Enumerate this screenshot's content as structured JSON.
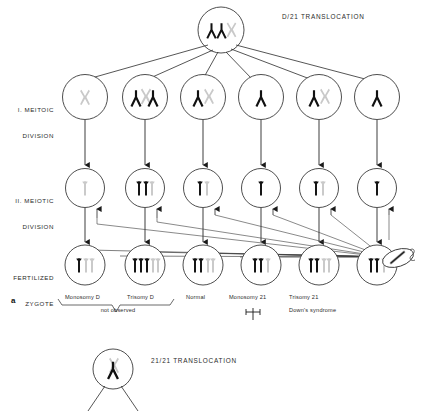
{
  "figure": {
    "panel_letter": "a",
    "title_top": "D/21 TRANSLOCATION",
    "title_bottom": "21/21 TRANSLOCATION",
    "row_labels": [
      {
        "line1": "I. MEITOIC",
        "line2": "DIVISION"
      },
      {
        "line1": "II. MEIOTIC",
        "line2": "DIVISION"
      },
      {
        "line1": "FERTILIZED",
        "line2": "ZYGOTE"
      }
    ],
    "outcome_labels": [
      {
        "text": "Monosomy D"
      },
      {
        "text": "Trisomy D"
      },
      {
        "text": "Normal"
      },
      {
        "text": "Monosomy 21"
      },
      {
        "text": "Trisomy 21"
      },
      {
        "text": "Down's syndrome"
      },
      {
        "text": "not observed"
      }
    ],
    "colors": {
      "chromosome_black": "#111111",
      "chromosome_gray": "#c9c9c9",
      "outline": "#3a3a3a",
      "text": "#2a2a2a"
    },
    "parent_cell": {
      "name": "D/21 translocation carrier",
      "chromosomes": [
        "translocation-black",
        "black",
        "gray"
      ]
    },
    "meiosis_i_cells": [
      {
        "id": 1,
        "chromosomes": [
          "gray"
        ]
      },
      {
        "id": 2,
        "chromosomes": [
          "black",
          "gray-overlap",
          "black"
        ]
      },
      {
        "id": 3,
        "chromosomes": [
          "black",
          "gray"
        ]
      },
      {
        "id": 4,
        "chromosomes": [
          "black"
        ]
      },
      {
        "id": 5,
        "chromosomes": [
          "black",
          "gray"
        ]
      },
      {
        "id": 6,
        "chromosomes": [
          "black"
        ]
      }
    ],
    "meiosis_ii_cells": [
      {
        "id": 1,
        "chromosomes": [
          "gray"
        ]
      },
      {
        "id": 2,
        "chromosomes": [
          "black",
          "black",
          "gray"
        ]
      },
      {
        "id": 3,
        "chromosomes": [
          "black",
          "gray"
        ]
      },
      {
        "id": 4,
        "chromosomes": [
          "black"
        ]
      },
      {
        "id": 5,
        "chromosomes": [
          "black",
          "gray"
        ]
      },
      {
        "id": 6,
        "chromosomes": [
          "black"
        ]
      }
    ],
    "zygote_cells": [
      {
        "id": 1,
        "chromosomes": [
          "black",
          "gray",
          "gray"
        ]
      },
      {
        "id": 2,
        "chromosomes": [
          "black",
          "black",
          "black",
          "gray",
          "gray"
        ]
      },
      {
        "id": 3,
        "chromosomes": [
          "black",
          "black",
          "gray",
          "gray"
        ]
      },
      {
        "id": 4,
        "chromosomes": [
          "black",
          "black",
          "gray"
        ]
      },
      {
        "id": 5,
        "chromosomes": [
          "black",
          "black",
          "gray",
          "gray"
        ]
      },
      {
        "id": 6,
        "chromosomes": [
          "black",
          "black",
          "gray"
        ]
      }
    ],
    "gamete": {
      "name": "normal gamete",
      "chromosomes": [
        "gray-diagonal"
      ]
    },
    "bottom_cell": {
      "chromosomes": [
        "gray",
        "translocation-black"
      ]
    }
  }
}
